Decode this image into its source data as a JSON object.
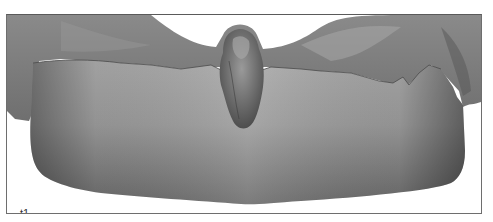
{
  "figure": {
    "panel_label": "t1",
    "colors": {
      "border": "#6e6e6e",
      "surface_light": "#b4b4b4",
      "surface_dark": "#5c5c5c",
      "background": "#ffffff"
    }
  }
}
